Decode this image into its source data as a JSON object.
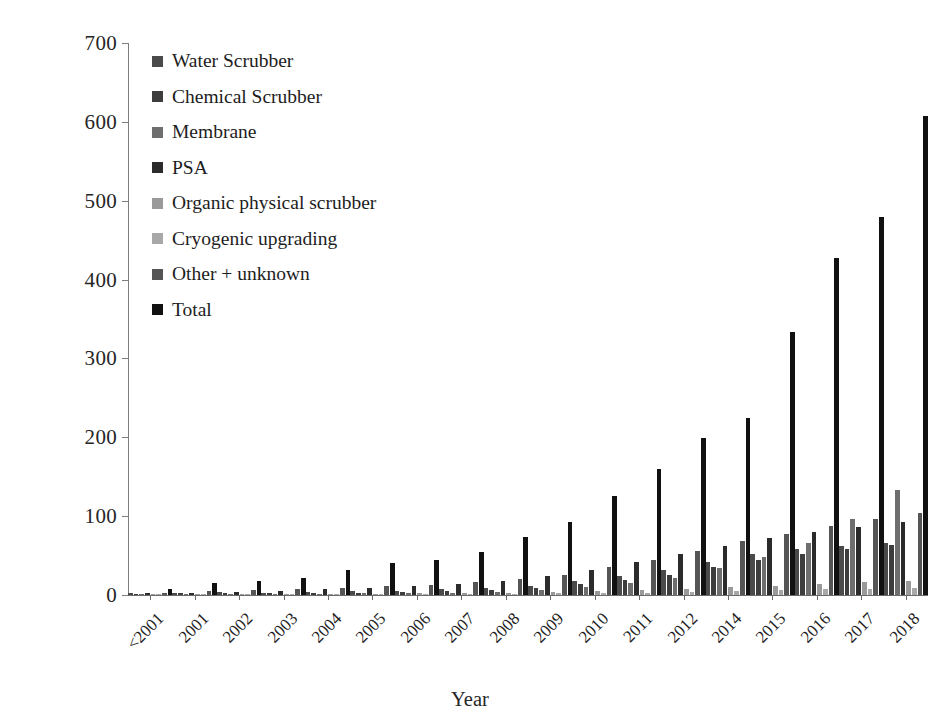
{
  "chart_data": {
    "type": "bar",
    "title": "",
    "xlabel": "Year",
    "ylabel": "Number of upgrading plants",
    "ylim": [
      0,
      700
    ],
    "yticks": [
      0,
      100,
      200,
      300,
      400,
      500,
      600,
      700
    ],
    "grid": false,
    "legend_position": "top-left inside plot",
    "categories": [
      "<2001",
      "2001",
      "2002",
      "2003",
      "2004",
      "2005",
      "2006",
      "2007",
      "2008",
      "2009",
      "2010",
      "2011",
      "2012",
      "2014",
      "2015",
      "2016",
      "2017",
      "2018"
    ],
    "series": [
      {
        "name": "Water Scrubber",
        "color": "#4a4a4a",
        "values": [
          2,
          3,
          4,
          3,
          4,
          5,
          5,
          7,
          9,
          12,
          18,
          24,
          32,
          42,
          52,
          58,
          62,
          66
        ]
      },
      {
        "name": "Chemical Scrubber",
        "color": "#3d3d3d",
        "values": [
          1,
          2,
          2,
          2,
          3,
          3,
          4,
          5,
          6,
          9,
          14,
          19,
          26,
          35,
          45,
          52,
          58,
          64
        ]
      },
      {
        "name": "Membrane",
        "color": "#6e6e6e",
        "values": [
          0,
          1,
          1,
          1,
          1,
          2,
          2,
          3,
          4,
          6,
          10,
          15,
          22,
          34,
          48,
          66,
          96,
          133
        ]
      },
      {
        "name": "PSA",
        "color": "#2b2b2b",
        "values": [
          2,
          3,
          4,
          5,
          7,
          9,
          11,
          14,
          18,
          24,
          32,
          42,
          52,
          62,
          72,
          80,
          86,
          92
        ]
      },
      {
        "name": "Organic physical scrubber",
        "color": "#9a9a9a",
        "values": [
          0,
          1,
          1,
          1,
          1,
          1,
          2,
          2,
          3,
          4,
          5,
          6,
          8,
          10,
          12,
          14,
          16,
          18
        ]
      },
      {
        "name": "Cryogenic upgrading",
        "color": "#a8a8a8",
        "values": [
          0,
          0,
          0,
          0,
          0,
          0,
          1,
          1,
          1,
          2,
          2,
          3,
          4,
          5,
          6,
          7,
          8,
          9
        ]
      },
      {
        "name": "Other + unknown",
        "color": "#555555",
        "values": [
          3,
          5,
          6,
          7,
          9,
          11,
          13,
          16,
          20,
          26,
          36,
          45,
          56,
          68,
          78,
          88,
          96,
          104
        ]
      },
      {
        "name": "Total",
        "color": "#111111",
        "values": [
          8,
          15,
          18,
          22,
          32,
          40,
          45,
          54,
          74,
          93,
          126,
          160,
          199,
          224,
          334,
          427,
          479,
          607
        ]
      }
    ]
  },
  "legend": {
    "items": [
      {
        "label": "Water Scrubber",
        "color": "#4a4a4a"
      },
      {
        "label": "Chemical Scrubber",
        "color": "#3d3d3d"
      },
      {
        "label": "Membrane",
        "color": "#6e6e6e"
      },
      {
        "label": "PSA",
        "color": "#2b2b2b"
      },
      {
        "label": "Organic physical scrubber",
        "color": "#9a9a9a"
      },
      {
        "label": "Cryogenic upgrading",
        "color": "#a8a8a8"
      },
      {
        "label": "Other + unknown",
        "color": "#555555"
      },
      {
        "label": "Total",
        "color": "#111111"
      }
    ]
  }
}
